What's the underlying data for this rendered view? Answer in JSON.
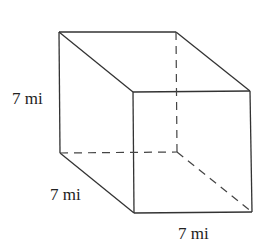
{
  "diagram": {
    "type": "cube",
    "edge_length": "7 mi",
    "colors": {
      "stroke": "#333333",
      "hidden_stroke": "#444444",
      "text": "#222222"
    },
    "labels": {
      "height": "7 mi",
      "depth": "7 mi",
      "width": "7 mi"
    }
  }
}
